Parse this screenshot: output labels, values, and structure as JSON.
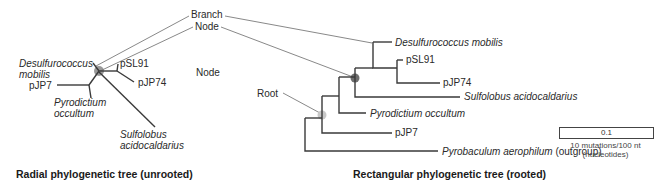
{
  "callouts": {
    "branch": "Branch",
    "node": "Node",
    "node_free": "Node",
    "root": "Root"
  },
  "radial": {
    "caption": "Radial phylogenetic tree (unrooted)",
    "taxa": {
      "desulfurococcus_1": "Desulfurococcus",
      "desulfurococcus_2": "mobilis",
      "psl91": "pSL91",
      "pjp74": "pJP74",
      "pjp7": "pJP7",
      "pyrodictium_1": "Pyrodictium",
      "pyrodictium_2": "occultum",
      "sulfolobus_1": "Sulfolobus",
      "sulfolobus_2": "acidocaldarius"
    }
  },
  "rectangular": {
    "caption": "Rectangular phylogenetic tree (rooted)",
    "taxa": {
      "desulfurococcus": "Desulfurococcus mobilis",
      "psl91": "pSL91",
      "pjp74": "pJP74",
      "sulfolobus": "Sulfolobus acidocaldarius",
      "pyrodictium": "Pyrodictium occultum",
      "pjp7": "pJP7",
      "pyrobaculum": "Pyrobaculum aerophilum",
      "outgroup": "(outgroup)"
    }
  },
  "scale_bar": {
    "value": "0.1",
    "label_1": "10 mutations/100 nt",
    "label_2": "(nucleotides)"
  },
  "colors": {
    "line": "#3a3a3a",
    "node": "#555555",
    "root_node": "#bbbbbb",
    "text": "#2a2a2a"
  }
}
